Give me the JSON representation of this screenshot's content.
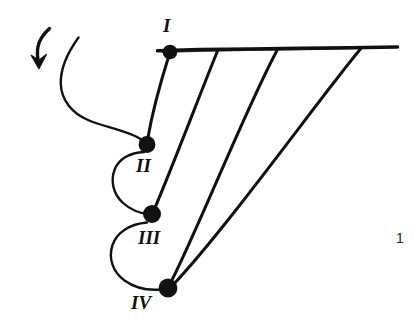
{
  "figure": {
    "title": "",
    "page_number": "1",
    "ink_color": "#111111",
    "background_color": "#ffffff",
    "nodes": [
      {
        "id": "I",
        "label": "I",
        "x": 170,
        "y": 52,
        "radius": 7.5
      },
      {
        "id": "II",
        "label": "II",
        "x": 147,
        "y": 144,
        "radius": 8.5
      },
      {
        "id": "III",
        "label": "III",
        "x": 152,
        "y": 214,
        "radius": 9.0
      },
      {
        "id": "IV",
        "label": "IV",
        "x": 168,
        "y": 288,
        "radius": 9.5
      }
    ],
    "baseline": {
      "x1": 157,
      "y1": 50,
      "x2": 398,
      "y2": 47
    },
    "arrow": {
      "name": "curved-down-arrow",
      "x": 40,
      "y": 45
    },
    "loops": [
      {
        "name": "loop-outer-to-II",
        "from": [
          78,
          38
        ],
        "to": [
          147,
          144
        ]
      },
      {
        "name": "loop-II-to-III",
        "from": [
          147,
          144
        ],
        "to": [
          152,
          214
        ]
      },
      {
        "name": "loop-III-to-IV",
        "from": [
          152,
          214
        ],
        "to": [
          168,
          288
        ]
      }
    ],
    "chords": [
      {
        "name": "chord-I-to-II",
        "from": [
          170,
          52
        ],
        "to": [
          147,
          144
        ]
      },
      {
        "name": "chord-bar-to-III",
        "from": [
          218,
          50
        ],
        "to": [
          152,
          214
        ]
      },
      {
        "name": "chord-bar-to-IV",
        "from": [
          278,
          50
        ],
        "to": [
          168,
          288
        ]
      },
      {
        "name": "chord-bar-long",
        "from": [
          362,
          48
        ],
        "to": [
          168,
          288
        ]
      }
    ]
  }
}
